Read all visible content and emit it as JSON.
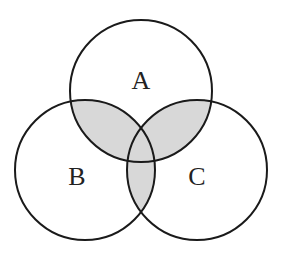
{
  "diagram": {
    "type": "venn-3",
    "sets": [
      {
        "label": "A",
        "cx": 141,
        "cy": 91,
        "r": 71
      },
      {
        "label": "B",
        "cx": 85,
        "cy": 170,
        "r": 70
      },
      {
        "label": "C",
        "cx": 197,
        "cy": 170,
        "r": 70
      }
    ],
    "shaded_regions": [
      "A∩B",
      "A∩C",
      "B∩C",
      "A∩B∩C"
    ],
    "shade_color": "#d8d8d8",
    "stroke_color": "#1a1a1a"
  }
}
